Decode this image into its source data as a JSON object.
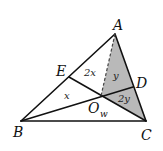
{
  "diagram": {
    "type": "geometry-triangle",
    "colors": {
      "line": "#111111",
      "shade": "#b9b9b9",
      "background": "#ffffff"
    },
    "points": {
      "A": {
        "label": "A",
        "x": 115,
        "y": 34
      },
      "B": {
        "label": "B",
        "x": 21,
        "y": 121
      },
      "C": {
        "label": "C",
        "x": 146,
        "y": 121
      },
      "D": {
        "label": "D",
        "x": 133,
        "y": 87
      },
      "E": {
        "label": "E",
        "x": 69,
        "y": 77
      },
      "O": {
        "label": "O",
        "subscript": "w",
        "x": 101,
        "y": 96
      }
    },
    "segments": [
      "AB",
      "BC",
      "CA",
      "BD",
      "CE",
      "AO (dashed)"
    ],
    "shaded_regions": [
      "AOD",
      "DOC"
    ],
    "area_labels": {
      "EOA": "2x",
      "AOD": "y",
      "DOC": "2y",
      "BOE": "x"
    }
  }
}
